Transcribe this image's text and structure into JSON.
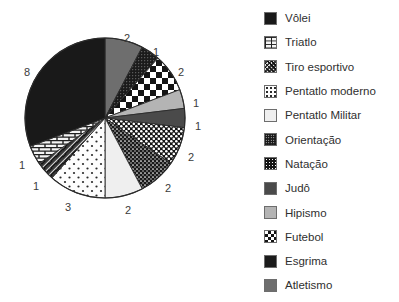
{
  "chart_data": {
    "type": "pie",
    "title": "",
    "xlabel": "",
    "ylabel": "",
    "total": 26,
    "legend_position": "right",
    "grid": false,
    "start_angle_deg": 0,
    "direction": "clockwise",
    "categories": [
      "Atletismo",
      "Esgrima",
      "Futebol",
      "Hipismo",
      "Judô",
      "Natação",
      "Orientação",
      "Pentatlo Militar",
      "Pentatlo moderno",
      "Tiro esportivo",
      "Triatlo",
      "Vôlei"
    ],
    "values": [
      2,
      1,
      2,
      1,
      1,
      2,
      2,
      2,
      3,
      1,
      1,
      8
    ],
    "slices": [
      {
        "label": "Atletismo",
        "value": 2,
        "fill": "solid-gray",
        "color": "#6e6e6e",
        "label_x": 127,
        "label_y": 38
      },
      {
        "label": "Esgrima",
        "value": 1,
        "fill": "speckle-dark",
        "color": "#1b1b1b",
        "label_x": 156,
        "label_y": 52
      },
      {
        "label": "Futebol",
        "value": 2,
        "fill": "checkerboard",
        "color": "#141414",
        "label_x": 181,
        "label_y": 72
      },
      {
        "label": "Hipismo",
        "value": 1,
        "fill": "solid-lightgray",
        "color": "#b4b4b4",
        "label_x": 196,
        "label_y": 103
      },
      {
        "label": "Judô",
        "value": 1,
        "fill": "solid-darkgray",
        "color": "#4a4a4a",
        "label_x": 198,
        "label_y": 126
      },
      {
        "label": "Natação",
        "value": 2,
        "fill": "dots-dense",
        "color": "#151515",
        "label_x": 191,
        "label_y": 157
      },
      {
        "label": "Orientação",
        "value": 2,
        "fill": "speckle-mid",
        "color": "#191919",
        "label_x": 168,
        "label_y": 188
      },
      {
        "label": "Pentatlo Militar",
        "value": 2,
        "fill": "near-white",
        "color": "#efefef",
        "label_x": 128,
        "label_y": 210
      },
      {
        "label": "Pentatlo moderno",
        "value": 3,
        "fill": "dots-sparse",
        "color": "#fdfdfd",
        "label_x": 68,
        "label_y": 207
      },
      {
        "label": "Tiro esportivo",
        "value": 1,
        "fill": "crosshatch",
        "color": "#3a3a3a",
        "label_x": 36,
        "label_y": 186
      },
      {
        "label": "Triatlo",
        "value": 1,
        "fill": "brick",
        "color": "#f4f4f4",
        "label_x": 22,
        "label_y": 165
      },
      {
        "label": "Vôlei",
        "value": 8,
        "fill": "solid-black",
        "color": "#191919",
        "label_x": 27,
        "label_y": 72
      }
    ]
  },
  "legend": {
    "items": [
      {
        "label": "Vôlei",
        "fill": "solid-black",
        "swatch_name": "legend-swatch-volei"
      },
      {
        "label": "Triatlo",
        "fill": "brick",
        "swatch_name": "legend-swatch-triatlo"
      },
      {
        "label": "Tiro esportivo",
        "fill": "crosshatch",
        "swatch_name": "legend-swatch-tiro-esportivo"
      },
      {
        "label": "Pentatlo moderno",
        "fill": "dots-sparse",
        "swatch_name": "legend-swatch-pentatlo-moderno"
      },
      {
        "label": "Pentatlo Militar",
        "fill": "near-white",
        "swatch_name": "legend-swatch-pentatlo-militar"
      },
      {
        "label": "Orientação",
        "fill": "speckle-mid",
        "swatch_name": "legend-swatch-orientacao"
      },
      {
        "label": "Natação",
        "fill": "dots-dense",
        "swatch_name": "legend-swatch-natacao"
      },
      {
        "label": "Judô",
        "fill": "solid-darkgray",
        "swatch_name": "legend-swatch-judo"
      },
      {
        "label": "Hipismo",
        "fill": "solid-lightgray",
        "swatch_name": "legend-swatch-hipismo"
      },
      {
        "label": "Futebol",
        "fill": "checkerboard",
        "swatch_name": "legend-swatch-futebol"
      },
      {
        "label": "Esgrima",
        "fill": "speckle-dark",
        "swatch_name": "legend-swatch-esgrima"
      },
      {
        "label": "Atletismo",
        "fill": "solid-gray",
        "swatch_name": "legend-swatch-atletismo"
      }
    ]
  },
  "geometry": {
    "center_x": 105,
    "center_y": 118,
    "radius": 80
  },
  "colors": {
    "background": "#ffffff",
    "outline": "#2b2b2b",
    "label_text": "#3b3b3b",
    "legend_text": "#2f2f2f"
  }
}
